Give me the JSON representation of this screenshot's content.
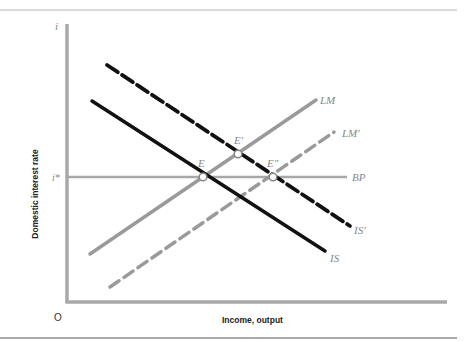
{
  "diagram": {
    "type": "IS-LM-BP",
    "y_axis": {
      "label": "Domestic interest rate",
      "symbol": "i",
      "reference_tick": "i*"
    },
    "x_axis": {
      "label": "Income, output"
    },
    "origin_label": "O",
    "curves": [
      {
        "id": "LM",
        "label": "LM",
        "style": "solid",
        "color": "#9a9a9a"
      },
      {
        "id": "LM_prime",
        "label": "LM′",
        "style": "dashed",
        "color": "#9a9a9a"
      },
      {
        "id": "IS",
        "label": "IS",
        "style": "solid",
        "color": "#111111"
      },
      {
        "id": "IS_prime",
        "label": "IS′",
        "style": "dashed",
        "color": "#111111"
      },
      {
        "id": "BP",
        "label": "BP",
        "style": "solid",
        "color": "#a8a8a8"
      }
    ],
    "points": [
      {
        "id": "E",
        "label": "E"
      },
      {
        "id": "E_prime",
        "label": "E′"
      },
      {
        "id": "E_double_prime",
        "label": "E″"
      }
    ],
    "colors": {
      "axis": "#a8a8a8",
      "border": "#9a9a9a",
      "black_curve": "#111111",
      "gray_curve": "#9a9a9a"
    }
  }
}
